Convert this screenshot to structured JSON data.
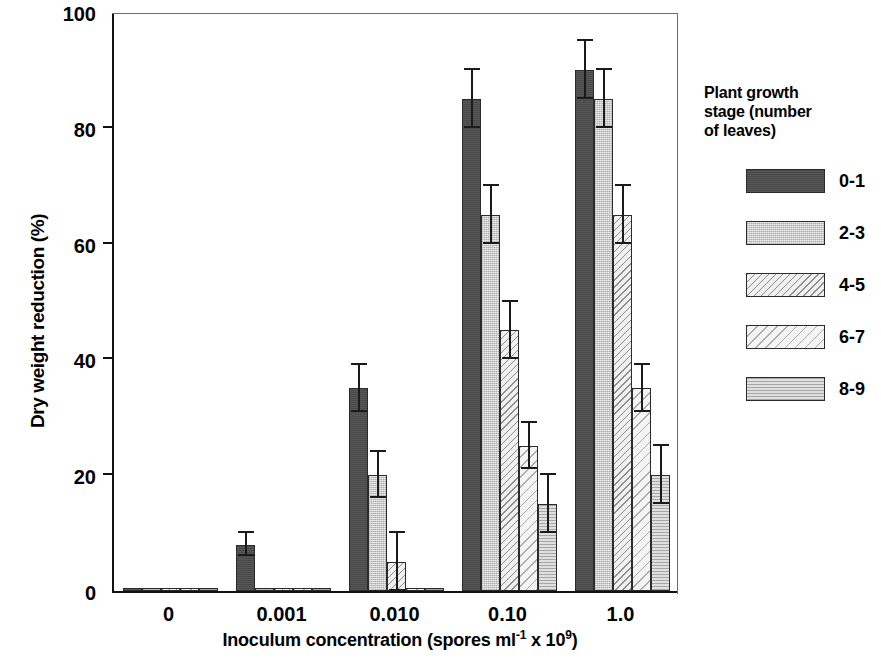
{
  "chart_data": {
    "type": "bar",
    "title": "",
    "xlabel": "Inoculum concentration (spores ml-1 x 109)",
    "ylabel": "Dry weight reduction (%)",
    "categories": [
      "0",
      "0.001",
      "0.010",
      "0.10",
      "1.0"
    ],
    "ylim": [
      0,
      100
    ],
    "yticks": [
      0,
      20,
      40,
      60,
      80,
      100
    ],
    "grid": false,
    "legend_position": "right",
    "series": [
      {
        "name": "0-1",
        "values": [
          0.5,
          8,
          35,
          85,
          90
        ],
        "errors": [
          0,
          2,
          4,
          5,
          5
        ],
        "swatch": "dark-solid"
      },
      {
        "name": "2-3",
        "values": [
          0.5,
          0.5,
          20,
          65,
          85
        ],
        "errors": [
          0,
          0,
          4,
          5,
          5
        ],
        "swatch": "gray-speckled"
      },
      {
        "name": "4-5",
        "values": [
          0.5,
          0.5,
          5,
          45,
          65
        ],
        "errors": [
          0,
          0,
          5,
          5,
          5
        ],
        "swatch": "light-hatch-dense"
      },
      {
        "name": "6-7",
        "values": [
          0.5,
          0.5,
          0.5,
          25,
          35
        ],
        "errors": [
          0,
          0,
          0,
          4,
          4
        ],
        "swatch": "light-hatch-sparse"
      },
      {
        "name": "8-9",
        "values": [
          0.5,
          0.5,
          0.5,
          15,
          20
        ],
        "errors": [
          0,
          0,
          0,
          5,
          5
        ],
        "swatch": "medium-gray"
      }
    ]
  },
  "axes": {
    "y_tick_labels": [
      "100",
      "80",
      "60",
      "40",
      "20",
      "0"
    ],
    "y_axis_title": "Dry weight reduction (%)",
    "x_tick_labels": [
      "0",
      "0.001",
      "0.010",
      "0.10",
      "1.0"
    ],
    "x_axis_title_main": "Inoculum concentration (spores ml",
    "x_axis_title_sup1": "-1",
    "x_axis_title_mid": " x 10",
    "x_axis_title_sup2": "9",
    "x_axis_title_end": ")"
  },
  "legend": {
    "title_line1": "Plant growth",
    "title_line2": "stage (number",
    "title_line3": "of leaves)",
    "items": [
      {
        "label": "0-1"
      },
      {
        "label": "2-3"
      },
      {
        "label": "4-5"
      },
      {
        "label": "6-7"
      },
      {
        "label": "8-9"
      }
    ]
  },
  "colors": {
    "series_0": "#4d4d4d",
    "series_1": "#d2d2d2",
    "series_2": "#f0f0f0",
    "series_3": "#f4f4f4",
    "series_4": "#c6c6c6",
    "axis": "#111111"
  }
}
